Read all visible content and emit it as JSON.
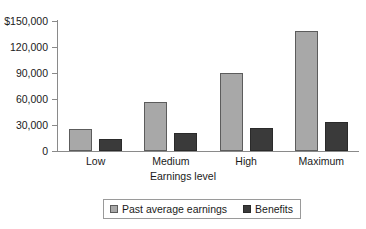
{
  "chart_data": {
    "type": "bar",
    "title": "",
    "xlabel": "Earnings level",
    "ylabel": "",
    "categories": [
      "Low",
      "Medium",
      "High",
      "Maximum"
    ],
    "series": [
      {
        "name": "Past average earnings",
        "color": "#a8a8a8",
        "values": [
          25000,
          57000,
          90000,
          139000
        ]
      },
      {
        "name": "Benefits",
        "color": "#3a3a3a",
        "values": [
          14000,
          21000,
          27000,
          33000
        ]
      }
    ],
    "ylim": [
      0,
      150000
    ],
    "yticks": [
      0,
      30000,
      60000,
      90000,
      120000,
      150000
    ],
    "ytick_labels": [
      "0",
      "30,000",
      "60,000",
      "90,000",
      "120,000",
      "$150,000"
    ],
    "grid": false,
    "legend_position": "bottom-center"
  }
}
